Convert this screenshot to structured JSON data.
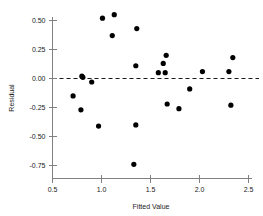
{
  "chart_data": {
    "type": "scatter",
    "title": "",
    "xlabel": "Fitted Value",
    "ylabel": "Residual",
    "xlim": [
      0.5,
      2.5
    ],
    "ylim": [
      -0.85,
      0.62
    ],
    "grid": false,
    "legend": null,
    "reference_line": {
      "orientation": "horizontal",
      "value": 0.0,
      "style": "dashed"
    },
    "xticks": [
      0.5,
      1.0,
      1.5,
      2.0,
      2.5
    ],
    "xtick_labels": [
      "0.5",
      "1.0",
      "1.5",
      "2.0",
      "2.5"
    ],
    "yticks": [
      0.5,
      0.25,
      0.0,
      -0.25,
      -0.5,
      -0.75
    ],
    "ytick_labels": [
      "0.50",
      "0.25",
      "0.00",
      "-0.25",
      "-0.50",
      "-0.75"
    ],
    "x": [
      0.71,
      0.79,
      0.8,
      0.81,
      0.9,
      0.97,
      1.01,
      1.02,
      1.11,
      1.13,
      1.33,
      1.35,
      1.36,
      1.58,
      1.63,
      1.65,
      1.67,
      1.68,
      1.79,
      1.9,
      2.03,
      2.3,
      2.32,
      2.34
    ],
    "y": [
      -0.15,
      -0.27,
      0.02,
      0.01,
      -0.03,
      -0.41,
      0.52,
      0.52,
      0.37,
      0.55,
      -0.74,
      -0.4,
      0.43,
      0.05,
      0.11,
      0.13,
      0.2,
      0.05,
      -0.26,
      -0.09,
      0.06,
      0.06,
      -0.23,
      0.18
    ],
    "points": [
      {
        "x": 0.71,
        "y": -0.15
      },
      {
        "x": 0.79,
        "y": -0.27
      },
      {
        "x": 0.8,
        "y": 0.02
      },
      {
        "x": 0.81,
        "y": 0.01
      },
      {
        "x": 0.9,
        "y": -0.03
      },
      {
        "x": 0.97,
        "y": -0.41
      },
      {
        "x": 1.01,
        "y": 0.52
      },
      {
        "x": 1.11,
        "y": 0.37
      },
      {
        "x": 1.13,
        "y": 0.55
      },
      {
        "x": 1.33,
        "y": -0.74
      },
      {
        "x": 1.35,
        "y": -0.4
      },
      {
        "x": 1.36,
        "y": 0.43
      },
      {
        "x": 1.35,
        "y": 0.11
      },
      {
        "x": 1.58,
        "y": 0.05
      },
      {
        "x": 1.63,
        "y": 0.13
      },
      {
        "x": 1.65,
        "y": 0.05
      },
      {
        "x": 1.66,
        "y": 0.2
      },
      {
        "x": 1.67,
        "y": -0.22
      },
      {
        "x": 1.79,
        "y": -0.26
      },
      {
        "x": 1.9,
        "y": -0.09
      },
      {
        "x": 2.03,
        "y": 0.06
      },
      {
        "x": 2.3,
        "y": 0.06
      },
      {
        "x": 2.32,
        "y": -0.23
      },
      {
        "x": 2.34,
        "y": 0.18
      }
    ],
    "marker": {
      "shape": "filled-circle",
      "size_px": 2.6,
      "color": "#000000"
    },
    "colors": {
      "axis": "#808080",
      "text": "#1a1a1a",
      "marker": "#000000",
      "reference_line": "#000000",
      "background": "#ffffff"
    }
  }
}
